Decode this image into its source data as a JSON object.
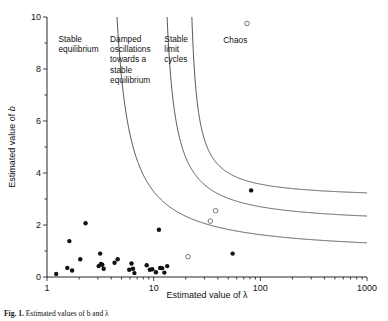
{
  "figure": {
    "caption_prefix": "Fig. 1.",
    "caption_text": "Estimated values of b and λ"
  },
  "chart_data": {
    "type": "scatter",
    "title": "",
    "xlabel": "Estimated value of λ",
    "ylabel": "Estimated value of b",
    "xscale": "log",
    "yscale": "linear",
    "xlim": [
      1,
      1000
    ],
    "ylim": [
      0,
      10
    ],
    "grid": false,
    "legend": "none",
    "xticks": [
      1,
      10,
      100,
      1000
    ],
    "xticklabels": [
      "1",
      "10",
      "100",
      "1000"
    ],
    "yticks": [
      0,
      2,
      4,
      6,
      8,
      10
    ],
    "yticklabels": [
      "0",
      "2",
      "4",
      "6",
      "8",
      "10"
    ],
    "yminorticks": [
      1,
      3,
      5,
      7,
      9
    ],
    "series": [
      {
        "name": "filled-points",
        "marker": "filled-circle",
        "color": "#111111",
        "points": [
          [
            1.22,
            0.12
          ],
          [
            1.55,
            0.35
          ],
          [
            1.62,
            1.38
          ],
          [
            1.72,
            0.25
          ],
          [
            2.05,
            0.68
          ],
          [
            2.3,
            2.07
          ],
          [
            3.05,
            0.42
          ],
          [
            3.15,
            0.9
          ],
          [
            3.2,
            0.5
          ],
          [
            3.3,
            0.47
          ],
          [
            3.4,
            0.32
          ],
          [
            4.6,
            0.68
          ],
          [
            4.3,
            0.55
          ],
          [
            5.9,
            0.28
          ],
          [
            6.2,
            0.52
          ],
          [
            6.4,
            0.32
          ],
          [
            6.6,
            0.15
          ],
          [
            8.6,
            0.45
          ],
          [
            9.2,
            0.28
          ],
          [
            9.7,
            0.3
          ],
          [
            10.5,
            0.18
          ],
          [
            11.2,
            1.82
          ],
          [
            11.5,
            0.35
          ],
          [
            12.0,
            0.34
          ],
          [
            12.6,
            0.17
          ],
          [
            13.4,
            0.42
          ],
          [
            55.0,
            0.9
          ],
          [
            82.0,
            3.33
          ]
        ]
      },
      {
        "name": "open-points",
        "marker": "open-circle",
        "color": "#555555",
        "points": [
          [
            21.0,
            0.78
          ],
          [
            34.0,
            2.15
          ],
          [
            38.0,
            2.55
          ],
          [
            75.0,
            9.75
          ]
        ]
      }
    ],
    "boundary_curves": [
      {
        "name": "stable-equilibrium-to-damped-oscillations",
        "x_asymptote": 3.4,
        "y_asymptote": 0.85,
        "description": "separates Stable equilibrium from Damped oscillations"
      },
      {
        "name": "damped-oscillations-to-stable-limit-cycles",
        "x_asymptote": 11.0,
        "y_asymptote": 2.0,
        "description": "separates Damped oscillations from Stable limit cycles"
      },
      {
        "name": "stable-limit-cycles-to-chaos",
        "x_asymptote": 20.0,
        "y_asymptote": 3.0,
        "description": "separates Stable limit cycles from Chaos"
      }
    ],
    "region_labels": [
      {
        "id": "stable-equilibrium",
        "lines": [
          "Stable",
          "equilibrium"
        ],
        "x": 1.28,
        "y": 9.05
      },
      {
        "id": "damped-oscillations",
        "lines": [
          "Damped",
          "oscillations",
          "towards a",
          "stable",
          "equilibrium"
        ],
        "x": 3.9,
        "y": 9.05
      },
      {
        "id": "stable-limit-cycles",
        "lines": [
          "Stable",
          "limit",
          "cycles"
        ],
        "x": 12.6,
        "y": 9.05
      },
      {
        "id": "chaos",
        "lines": [
          "Chaos"
        ],
        "x": 45.0,
        "y": 9.0
      }
    ]
  }
}
